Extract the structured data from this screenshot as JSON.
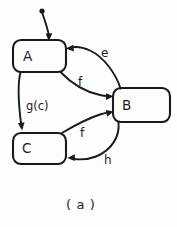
{
  "figure": {
    "caption": "( a )",
    "kind": "state-transition-diagram",
    "background_color": "#fefefe",
    "ink_color": "#1a1a1a"
  },
  "states": [
    {
      "id": "A",
      "label": "A",
      "x": 13,
      "y": 40,
      "width": 53,
      "height": 32,
      "corner_radius": 8
    },
    {
      "id": "B",
      "label": "B",
      "x": 113,
      "y": 88,
      "width": 57,
      "height": 34,
      "corner_radius": 8
    },
    {
      "id": "C",
      "label": "C",
      "x": 13,
      "y": 133,
      "width": 53,
      "height": 31,
      "corner_radius": 8
    }
  ],
  "initial": {
    "name": "initial-state-marker",
    "dot_x": 42,
    "dot_y": 11,
    "dot_radius": 2.6,
    "target_state": "A",
    "arrow_x": 49,
    "arrow_y": 40
  },
  "transitions": [
    {
      "id": "e",
      "label": "e",
      "from": "B",
      "to": "A",
      "label_x": 101,
      "label_y": 57
    },
    {
      "id": "f-ab",
      "label": "f",
      "from": "A",
      "to": "B",
      "label_x": 78,
      "label_y": 86
    },
    {
      "id": "g-ac",
      "label": "g(c)",
      "from": "A",
      "to": "C",
      "label_x": 26,
      "label_y": 110
    },
    {
      "id": "f-cb",
      "label": "f",
      "from": "C",
      "to": "B",
      "label_x": 80,
      "label_y": 137
    },
    {
      "id": "h-bc",
      "label": "h",
      "from": "B",
      "to": "C",
      "label_x": 104,
      "label_y": 164
    }
  ]
}
